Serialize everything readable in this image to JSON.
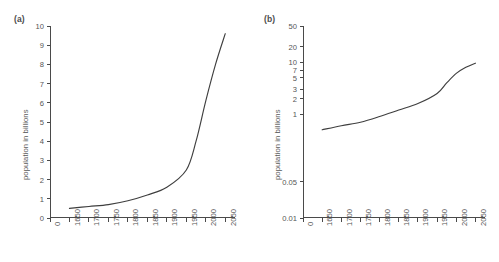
{
  "figure": {
    "background": "#ffffff",
    "curve_color": "#3f3f3f",
    "axis_color": "#4a4a4a",
    "text_color": "#555555"
  },
  "panels": [
    {
      "id": "a",
      "label": "(a)"
    },
    {
      "id": "b",
      "label": "(b)"
    }
  ],
  "chart_data": [
    {
      "type": "line",
      "title": "",
      "panel_label": "(a)",
      "xlabel": "",
      "ylabel": "population in billions",
      "yscale": "linear",
      "xscale": "linear",
      "grid": false,
      "legend": "none",
      "xlim": [
        1600,
        2075
      ],
      "ylim": [
        0,
        10
      ],
      "xticks": [
        "0",
        "1650",
        "1700",
        "1750",
        "1800",
        "1850",
        "1900",
        "1950",
        "2000",
        "2050"
      ],
      "xtick_values": [
        1600,
        1650,
        1700,
        1750,
        1800,
        1850,
        1900,
        1950,
        2000,
        2050
      ],
      "yticks": [
        "0",
        "1",
        "2",
        "3",
        "4",
        "5",
        "6",
        "7",
        "8",
        "9",
        "10"
      ],
      "ytick_values": [
        0,
        1,
        2,
        3,
        4,
        5,
        6,
        7,
        8,
        9,
        10
      ],
      "series": [
        {
          "name": "world population",
          "x": [
            1650,
            1700,
            1750,
            1800,
            1850,
            1900,
            1950,
            1975,
            2000,
            2025,
            2050
          ],
          "values": [
            0.5,
            0.6,
            0.7,
            0.9,
            1.2,
            1.6,
            2.5,
            4.0,
            6.1,
            8.0,
            9.6
          ]
        }
      ]
    },
    {
      "type": "line",
      "title": "",
      "panel_label": "(b)",
      "xlabel": "",
      "ylabel": "population in billions",
      "yscale": "log",
      "xscale": "linear",
      "grid": false,
      "legend": "none",
      "xlim": [
        1600,
        2075
      ],
      "ylim": [
        0.01,
        50
      ],
      "xticks": [
        "0",
        "1650",
        "1700",
        "1750",
        "1800",
        "1850",
        "1900",
        "1950",
        "2000",
        "2050"
      ],
      "xtick_values": [
        1600,
        1650,
        1700,
        1750,
        1800,
        1850,
        1900,
        1950,
        2000,
        2050
      ],
      "yticks": [
        "50",
        "20",
        "10",
        "7",
        "5",
        "3",
        "2",
        "1",
        "0.05",
        "0.01"
      ],
      "ytick_values": [
        50,
        20,
        10,
        7,
        5,
        3,
        2,
        1,
        0.05,
        0.01
      ],
      "series": [
        {
          "name": "world population",
          "x": [
            1650,
            1700,
            1750,
            1800,
            1850,
            1900,
            1950,
            1975,
            2000,
            2025,
            2050
          ],
          "values": [
            0.5,
            0.6,
            0.7,
            0.9,
            1.2,
            1.6,
            2.5,
            4.0,
            6.1,
            8.0,
            9.6
          ]
        }
      ]
    }
  ]
}
